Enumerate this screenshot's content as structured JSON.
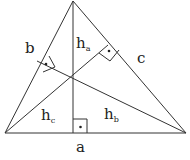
{
  "diagram": {
    "type": "triangle-altitudes",
    "stroke_color": "#333333",
    "background": "#ffffff",
    "vertices": {
      "A": [
        73,
        1
      ],
      "B": [
        5,
        133
      ],
      "C": [
        186,
        133
      ]
    },
    "orthocenter": [
      73,
      75
    ],
    "sides": [
      {
        "name": "a",
        "label": "a",
        "from": "B",
        "to": "C",
        "label_pos": [
          80,
          152
        ]
      },
      {
        "name": "b",
        "label": "b",
        "from": "B",
        "to": "A",
        "label_pos": [
          25,
          53
        ]
      },
      {
        "name": "c",
        "label": "c",
        "from": "A",
        "to": "C",
        "label_pos": [
          137,
          63
        ]
      }
    ],
    "altitudes": [
      {
        "name": "h_a",
        "base": "h",
        "sub": "a",
        "from": [
          73,
          1
        ],
        "foot": [
          73,
          133
        ],
        "label_pos": [
          76,
          48
        ]
      },
      {
        "name": "h_b",
        "base": "h",
        "sub": "b",
        "from": [
          186,
          133
        ],
        "foot": [
          37,
          61
        ],
        "label_pos": [
          104,
          119
        ]
      },
      {
        "name": "h_c",
        "base": "h",
        "sub": "c",
        "from": [
          5,
          133
        ],
        "foot": [
          108,
          45
        ],
        "label_pos": [
          41,
          120
        ]
      }
    ],
    "right_angle_markers": 3
  }
}
